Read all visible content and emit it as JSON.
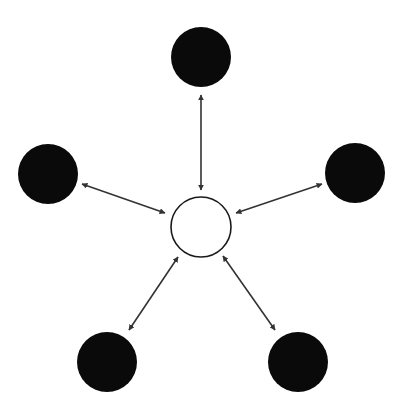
{
  "diagram": {
    "type": "hub-and-spoke",
    "colors": {
      "background": "#ffffff",
      "outer_node_fill": "#0a0a0a",
      "hub_fill": "#ffffff",
      "hub_stroke": "#1a1a1a",
      "arrow": "#333333"
    },
    "hub": {
      "id": "hub",
      "cx": 201,
      "cy": 227,
      "r": 30,
      "filled": false
    },
    "nodes": [
      {
        "id": "top",
        "cx": 201,
        "cy": 57,
        "r": 30,
        "filled": true
      },
      {
        "id": "left",
        "cx": 48,
        "cy": 174,
        "r": 30,
        "filled": true
      },
      {
        "id": "right",
        "cx": 355,
        "cy": 173,
        "r": 30,
        "filled": true
      },
      {
        "id": "bottom-left",
        "cx": 107,
        "cy": 362,
        "r": 30,
        "filled": true
      },
      {
        "id": "bottom-right",
        "cx": 298,
        "cy": 362,
        "r": 30,
        "filled": true
      }
    ],
    "edges": [
      {
        "from": "top",
        "to": "hub",
        "direction": "bidirectional",
        "x1": 201,
        "y1": 95,
        "x2": 201,
        "y2": 190
      },
      {
        "from": "left",
        "to": "hub",
        "direction": "bidirectional",
        "x1": 82,
        "y1": 184,
        "x2": 165,
        "y2": 213
      },
      {
        "from": "right",
        "to": "hub",
        "direction": "bidirectional",
        "x1": 322,
        "y1": 184,
        "x2": 236,
        "y2": 213
      },
      {
        "from": "bottom-left",
        "to": "hub",
        "direction": "bidirectional",
        "x1": 129,
        "y1": 330,
        "x2": 178,
        "y2": 257
      },
      {
        "from": "bottom-right",
        "to": "hub",
        "direction": "bidirectional",
        "x1": 275,
        "y1": 330,
        "x2": 223,
        "y2": 256
      }
    ]
  }
}
